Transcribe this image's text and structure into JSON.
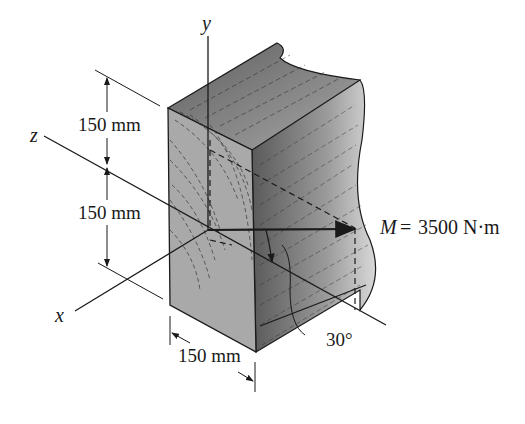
{
  "figure": {
    "axes": {
      "x_label": "x",
      "y_label": "y",
      "z_label": "z"
    },
    "dimensions": {
      "upper_height": "150 mm",
      "lower_height": "150 mm",
      "width": "150 mm"
    },
    "moment": {
      "symbol": "M",
      "equals": "=",
      "value": "3500 N·m"
    },
    "angle": "30°",
    "colors": {
      "front_face": "#a9a9a9",
      "side_face": "#8a8a8a",
      "top_face": "#6e6e6e",
      "lines": "#1a1a1a"
    }
  }
}
